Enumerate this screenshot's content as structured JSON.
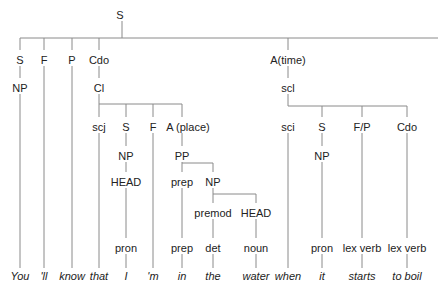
{
  "diagram": {
    "type": "syntax-tree",
    "line_color": "#8a8a8a",
    "nodes": [
      {
        "id": "root",
        "label": "S",
        "x": 120,
        "y": 10
      },
      {
        "id": "s1",
        "label": "S",
        "x": 20,
        "y": 55
      },
      {
        "id": "f1",
        "label": "F",
        "x": 44,
        "y": 55
      },
      {
        "id": "p1",
        "label": "P",
        "x": 72,
        "y": 55
      },
      {
        "id": "cdo1",
        "label": "Cdo",
        "x": 99,
        "y": 55
      },
      {
        "id": "np1",
        "label": "NP",
        "x": 20,
        "y": 83
      },
      {
        "id": "cl",
        "label": "Cl",
        "x": 99,
        "y": 83
      },
      {
        "id": "scj",
        "label": "scj",
        "x": 99,
        "y": 122
      },
      {
        "id": "s2",
        "label": "S",
        "x": 126,
        "y": 122
      },
      {
        "id": "f2",
        "label": "F",
        "x": 153,
        "y": 122
      },
      {
        "id": "aplace",
        "label": "A (place)",
        "x": 188,
        "y": 122
      },
      {
        "id": "np2",
        "label": "NP",
        "x": 126,
        "y": 151
      },
      {
        "id": "pp",
        "label": "PP",
        "x": 182,
        "y": 151
      },
      {
        "id": "head1",
        "label": "HEAD",
        "x": 126,
        "y": 177
      },
      {
        "id": "prep1",
        "label": "prep",
        "x": 182,
        "y": 177
      },
      {
        "id": "np3",
        "label": "NP",
        "x": 213,
        "y": 177
      },
      {
        "id": "premod",
        "label": "premod",
        "x": 213,
        "y": 208
      },
      {
        "id": "head2",
        "label": "HEAD",
        "x": 256,
        "y": 208
      },
      {
        "id": "pron1",
        "label": "pron",
        "x": 126,
        "y": 243
      },
      {
        "id": "prep2",
        "label": "prep",
        "x": 182,
        "y": 243
      },
      {
        "id": "det",
        "label": "det",
        "x": 213,
        "y": 243
      },
      {
        "id": "noun",
        "label": "noun",
        "x": 256,
        "y": 243
      },
      {
        "id": "atime",
        "label": "A(time)",
        "x": 288,
        "y": 55
      },
      {
        "id": "scl",
        "label": "scl",
        "x": 288,
        "y": 83
      },
      {
        "id": "sci",
        "label": "sci",
        "x": 288,
        "y": 122
      },
      {
        "id": "s3",
        "label": "S",
        "x": 322,
        "y": 122
      },
      {
        "id": "fp",
        "label": "F/P",
        "x": 362,
        "y": 122
      },
      {
        "id": "cdo2",
        "label": "Cdo",
        "x": 407,
        "y": 122
      },
      {
        "id": "np4",
        "label": "NP",
        "x": 322,
        "y": 151
      },
      {
        "id": "pron2",
        "label": "pron",
        "x": 322,
        "y": 243
      },
      {
        "id": "lexverb1",
        "label": "lex verb",
        "x": 362,
        "y": 243
      },
      {
        "id": "lexverb2",
        "label": "lex verb",
        "x": 407,
        "y": 243
      }
    ],
    "words": [
      {
        "text": "You",
        "x": 20
      },
      {
        "text": "'ll",
        "x": 44
      },
      {
        "text": "know",
        "x": 72
      },
      {
        "text": "that",
        "x": 99
      },
      {
        "text": "I",
        "x": 126
      },
      {
        "text": "'m",
        "x": 153
      },
      {
        "text": "in",
        "x": 182
      },
      {
        "text": "the",
        "x": 213
      },
      {
        "text": "water",
        "x": 256
      },
      {
        "text": "when",
        "x": 288
      },
      {
        "text": "it",
        "x": 322
      },
      {
        "text": "starts",
        "x": 362
      },
      {
        "text": "to boil",
        "x": 407
      }
    ]
  }
}
